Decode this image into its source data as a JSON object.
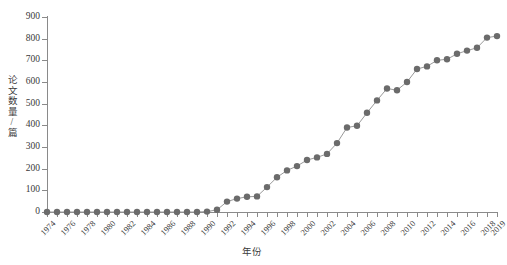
{
  "chart_data": {
    "type": "line",
    "title": "",
    "xlabel": "年份",
    "ylabel": "论文数量/篇",
    "xlim": [
      1974,
      2019
    ],
    "ylim": [
      0,
      900
    ],
    "ytick_step": 100,
    "grid": false,
    "legend": "none",
    "marker": "filled-circle",
    "series_color": "#6b6b6b",
    "line_color": "#9a9a9a",
    "axis_color": "#8a8a8a",
    "text_color": "#3a3a3a",
    "x": [
      1974,
      1975,
      1976,
      1977,
      1978,
      1979,
      1980,
      1981,
      1982,
      1983,
      1984,
      1985,
      1986,
      1987,
      1988,
      1989,
      1990,
      1991,
      1992,
      1993,
      1994,
      1995,
      1996,
      1997,
      1998,
      1999,
      2000,
      2001,
      2002,
      2003,
      2004,
      2005,
      2006,
      2007,
      2008,
      2009,
      2010,
      2011,
      2012,
      2013,
      2014,
      2015,
      2016,
      2017,
      2018,
      2019
    ],
    "values": [
      0,
      0,
      0,
      0,
      0,
      0,
      0,
      0,
      0,
      0,
      0,
      0,
      0,
      0,
      0,
      0,
      2,
      10,
      48,
      62,
      70,
      72,
      115,
      160,
      192,
      212,
      240,
      252,
      268,
      318,
      390,
      398,
      458,
      515,
      570,
      562,
      600,
      660,
      672,
      700,
      705,
      730,
      745,
      758,
      805,
      812
    ],
    "ytick_labels": [
      "0",
      "100",
      "200",
      "300",
      "400",
      "500",
      "600",
      "700",
      "800",
      "900"
    ],
    "ytick_values": [
      0,
      100,
      200,
      300,
      400,
      500,
      600,
      700,
      800,
      900
    ],
    "xtick_labels": [
      "1974",
      "1976",
      "1978",
      "1980",
      "1982",
      "1984",
      "1986",
      "1988",
      "1990",
      "1992",
      "1994",
      "1996",
      "1998",
      "2000",
      "2002",
      "2004",
      "2006",
      "2008",
      "2010",
      "2012",
      "2014",
      "2016",
      "2018",
      "2019"
    ],
    "xtick_values": [
      1974,
      1976,
      1978,
      1980,
      1982,
      1984,
      1986,
      1988,
      1990,
      1992,
      1994,
      1996,
      1998,
      2000,
      2002,
      2004,
      2006,
      2008,
      2010,
      2012,
      2014,
      2016,
      2018,
      2019
    ]
  }
}
